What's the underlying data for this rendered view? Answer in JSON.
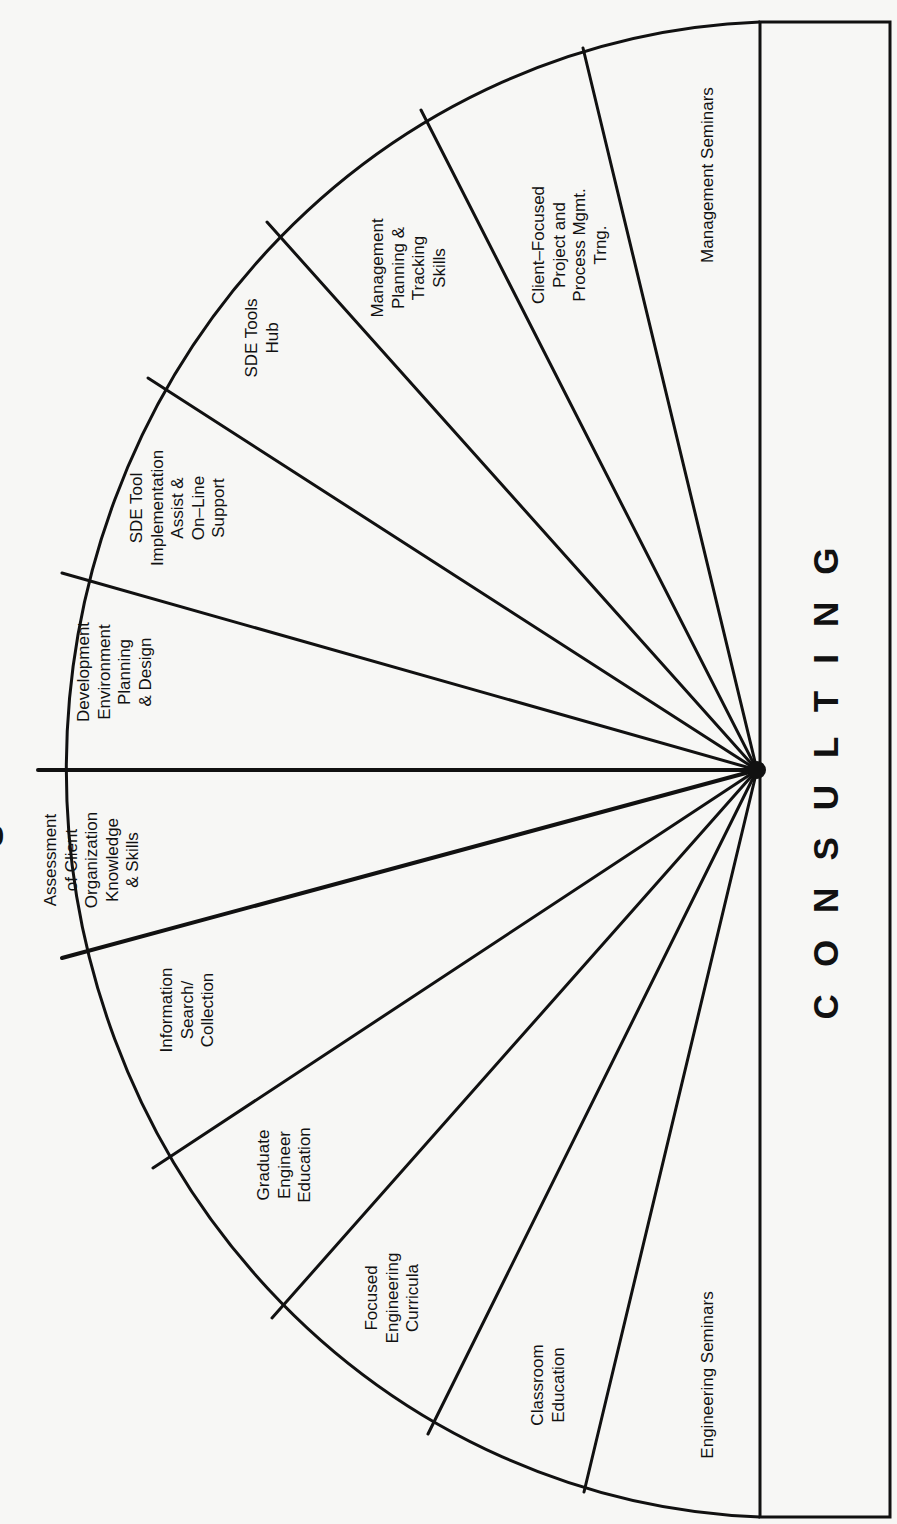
{
  "diagram": {
    "title_fragment": "S",
    "core": {
      "label": "CONSULTING"
    },
    "center": [
      757,
      770
    ],
    "segments": [
      {
        "id": "management-seminars",
        "label": "Management Seminars",
        "pos": [
          708,
          175
        ]
      },
      {
        "id": "client-focused-project-process-mgmt-trng",
        "label": "Client–Focused\nProject and\nProcess Mgmt.\nTrng.",
        "pos": [
          570,
          245
        ]
      },
      {
        "id": "management-planning-tracking-skills",
        "label": "Management\nPlanning &\nTracking\nSkills",
        "pos": [
          409,
          268
        ]
      },
      {
        "id": "sde-tools-hub",
        "label": "SDE Tools\nHub",
        "pos": [
          262,
          338
        ]
      },
      {
        "id": "sde-tool-implementation-assist-online-support",
        "label": "SDE Tool\nImplementation\nAssist &\nOn–Line\nSupport",
        "pos": [
          178,
          508
        ]
      },
      {
        "id": "development-environment-planning-design",
        "label": "Development\nEnvironment\nPlanning\n& Design",
        "pos": [
          115,
          672
        ]
      },
      {
        "id": "assessment-client-organization-knowledge-skills",
        "label": "Assessment\nof Client\nOrganization\nKnowledge\n& Skills",
        "pos": [
          92,
          860
        ]
      },
      {
        "id": "information-search-collection",
        "label": "Information\nSearch/\nCollection",
        "pos": [
          188,
          1010
        ]
      },
      {
        "id": "graduate-engineer-education",
        "label": "Graduate\nEngineer\nEducation",
        "pos": [
          285,
          1165
        ]
      },
      {
        "id": "focused-engineering-curricula",
        "label": "Focused\nEngineering\nCurricula",
        "pos": [
          393,
          1298
        ]
      },
      {
        "id": "classroom-education",
        "label": "Classroom\nEducation",
        "pos": [
          548,
          1385
        ]
      },
      {
        "id": "engineering-seminars",
        "label": "Engineering Seminars",
        "pos": [
          708,
          1375
        ]
      }
    ],
    "radial_endpoints": [
      [
        583,
        48
      ],
      [
        421,
        110
      ],
      [
        267,
        222
      ],
      [
        148,
        378
      ],
      [
        62,
        573
      ],
      [
        38,
        770
      ],
      [
        62,
        958
      ],
      [
        153,
        1168
      ],
      [
        272,
        1318
      ],
      [
        428,
        1434
      ],
      [
        584,
        1492
      ]
    ],
    "arc": {
      "start": [
        760,
        22
      ],
      "end": [
        760,
        1517
      ],
      "rx": 720,
      "ry": 748
    },
    "core_box": {
      "x": 760,
      "y": 22,
      "width": 130,
      "height": 1495
    },
    "colors": {
      "ink": "#111111",
      "paper": "#f7f7f5"
    }
  }
}
